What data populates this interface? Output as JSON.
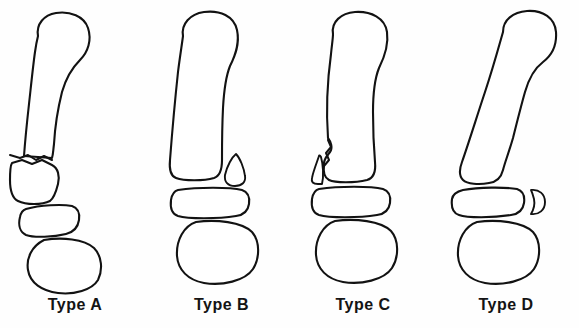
{
  "figure": {
    "background_color": "#fefefe",
    "ink_color": "#121212",
    "style": "line-drawing",
    "panel_count": 4
  },
  "panels": [
    {
      "id": "type-a",
      "label": "Type A",
      "x": 0,
      "width": 150,
      "bone_label": "proximal-phalanx",
      "fracture": "transverse fracture of distal shaft with angulated displaced distal fragment",
      "fragment_side": "none",
      "shaft_tilt": "angulated"
    },
    {
      "id": "type-b",
      "label": "Type B",
      "x": 150,
      "width": 143,
      "bone_label": "proximal-phalanx",
      "fracture": "lateral condylar fragment separated, teardrop shaped",
      "fragment_side": "lateral",
      "shaft_tilt": "straight"
    },
    {
      "id": "type-c",
      "label": "Type C",
      "x": 293,
      "width": 140,
      "bone_label": "proximal-phalanx",
      "fracture": "medial condylar triangular fragment separated",
      "fragment_side": "medial",
      "shaft_tilt": "straight"
    },
    {
      "id": "type-d",
      "label": "Type D",
      "x": 433,
      "width": 146,
      "bone_label": "proximal-phalanx",
      "fracture": "intact shaft with small lateral crescent fragment beside middle phalanx",
      "fragment_side": "lateral",
      "shaft_tilt": "oblique"
    }
  ],
  "captions": {
    "type_a": "Type A",
    "type_b": "Type B",
    "type_c": "Type C",
    "type_d": "Type D"
  }
}
